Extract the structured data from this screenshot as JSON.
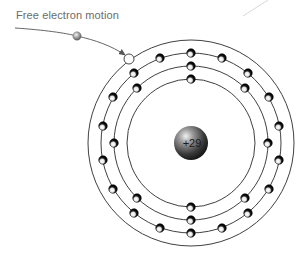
{
  "diagram": {
    "label": "Free electron motion",
    "nucleus": {
      "charge_label": "+29",
      "cx": 191,
      "cy": 143,
      "r": 17
    },
    "center": {
      "cx": 191,
      "cy": 143
    },
    "rings": [
      {
        "name": "outer-orbit",
        "r": 103
      },
      {
        "name": "shell-3",
        "r": 90
      },
      {
        "name": "shell-2",
        "r": 77
      },
      {
        "name": "shell-1",
        "r": 64
      }
    ],
    "electrons": {
      "shell-1": [
        [
          191,
          79
        ],
        [
          191,
          207
        ]
      ],
      "shell-2": [
        [
          191,
          66
        ],
        [
          191,
          220
        ],
        [
          137,
          88
        ],
        [
          245,
          88
        ],
        [
          114,
          143
        ],
        [
          268,
          143
        ],
        [
          137,
          198
        ],
        [
          245,
          198
        ]
      ],
      "shell-3": [
        [
          191,
          53
        ],
        [
          191,
          233
        ],
        [
          160,
          58
        ],
        [
          222,
          58
        ],
        [
          134,
          73
        ],
        [
          248,
          73
        ],
        [
          113,
          97
        ],
        [
          269,
          97
        ],
        [
          103,
          126
        ],
        [
          279,
          126
        ],
        [
          103,
          160
        ],
        [
          279,
          160
        ],
        [
          113,
          189
        ],
        [
          269,
          189
        ],
        [
          134,
          213
        ],
        [
          248,
          213
        ],
        [
          160,
          228
        ],
        [
          222,
          228
        ]
      ]
    },
    "free_electron": {
      "cx": 77,
      "cy": 36
    },
    "vacancy": {
      "cx": 129,
      "cy": 59
    },
    "colors": {
      "ring": "#2a2a2a",
      "arrow": "#555555",
      "text": "#6b6b6b",
      "electron_dark": "#111111",
      "free_electron": "#9a9a9a"
    }
  }
}
